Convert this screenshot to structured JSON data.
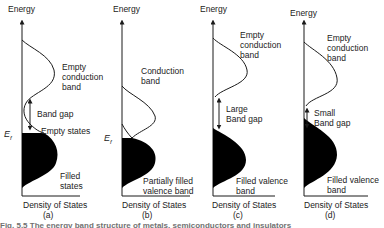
{
  "diagram": {
    "type": "band-structure-density-of-states",
    "panels": [
      {
        "id": "a",
        "tag": "(a)",
        "y_axis_label": "Energy",
        "x_axis_label": "Density of States",
        "fermi_label": "E",
        "fermi_sub": "f",
        "upper_band_label": "Empty\nconduction\nband",
        "gap_label": "Band gap",
        "extra_label": "Empty states",
        "lower_band_label": "Filled\nstates"
      },
      {
        "id": "b",
        "tag": "(b)",
        "y_axis_label": "Energy",
        "x_axis_label": "Density of States",
        "fermi_label": "E",
        "fermi_sub": "f",
        "upper_band_label": "Conduction\nband",
        "lower_band_label": "Partially filled\nvalence band"
      },
      {
        "id": "c",
        "tag": "(c)",
        "y_axis_label": "Energy",
        "x_axis_label": "Density of States",
        "upper_band_label": "Empty\nconduction\nband",
        "gap_label": "Large\nBand gap",
        "lower_band_label": "Filled valence\nband"
      },
      {
        "id": "d",
        "tag": "(d)",
        "y_axis_label": "Energy",
        "x_axis_label": "Density of States",
        "upper_band_label": "Empty\nconduction\nband",
        "gap_label": "Small\nBand gap",
        "lower_band_label": "Filled valence\nband"
      }
    ],
    "caption": "Fig. 5.5 The energy band structure of metals, semiconductors and insulators",
    "colors": {
      "line": "#1a1a1a",
      "fill": "#000000",
      "background": "#ffffff"
    }
  }
}
